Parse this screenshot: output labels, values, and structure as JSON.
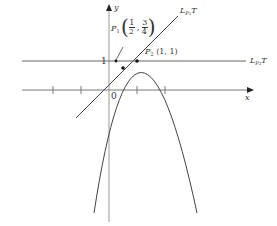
{
  "diagram": {
    "type": "function-graph-with-tangents",
    "curve": "y = 2x - x^2",
    "axes": {
      "x_label": "x",
      "y_label": "y",
      "origin_label": "0",
      "y_tick_label": "1"
    },
    "points": [
      {
        "name": "P",
        "sub": "1",
        "coords": "(1/2, 3/4)",
        "x_frac": "1",
        "x_den": "2",
        "y_frac": "3",
        "y_den": "4"
      },
      {
        "name": "P",
        "sub": "2",
        "coords": "(1, 1)"
      }
    ],
    "lines": [
      {
        "name": "L",
        "sub": "P1",
        "suffix": "T",
        "desc": "tangent at P1, slope 1"
      },
      {
        "name": "L",
        "sub": "P2",
        "suffix": "T",
        "desc": "tangent at P2, horizontal y=1"
      }
    ],
    "colors": {
      "ink": "#333333",
      "axis": "#888888"
    }
  },
  "labels": {
    "y": "y",
    "x": "x",
    "origin": "0",
    "one": "1",
    "p1": "P",
    "p1_sub": "1",
    "p1_open": "(",
    "p1_n1": "1",
    "p1_d1": "2",
    "p1_comma": ",",
    "p1_n2": "3",
    "p1_d2": "4",
    "p1_close": ")",
    "p2": "P",
    "p2_sub": "2",
    "p2_coords": "(1, 1)",
    "lp1": "L",
    "lp1_sub": "P",
    "lp1_subsub": "1",
    "lp1_t": "T",
    "lp2": "L",
    "lp2_sub": "P",
    "lp2_subsub": "2",
    "lp2_t": "T"
  }
}
